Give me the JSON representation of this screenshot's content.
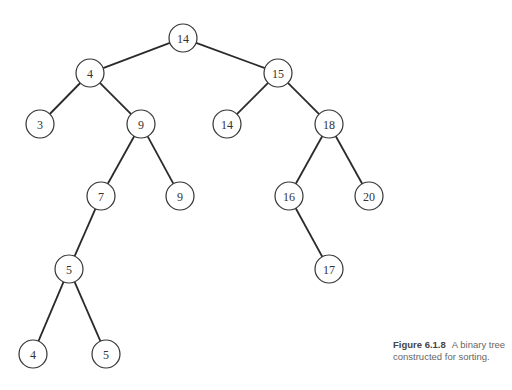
{
  "figure": {
    "caption_number": "Figure 6.1.8",
    "caption_text": "A binary tree constructed for sorting."
  },
  "tree": {
    "node_radius": 14,
    "nodes": [
      {
        "id": "n1",
        "label": "14",
        "x": 183,
        "y": 38
      },
      {
        "id": "n2",
        "label": "4",
        "x": 90,
        "y": 73
      },
      {
        "id": "n3",
        "label": "15",
        "x": 278,
        "y": 73
      },
      {
        "id": "n4",
        "label": "3",
        "x": 40,
        "y": 124
      },
      {
        "id": "n5",
        "label": "9",
        "x": 141,
        "y": 124
      },
      {
        "id": "n6",
        "label": "14",
        "x": 227,
        "y": 124
      },
      {
        "id": "n7",
        "label": "18",
        "x": 329,
        "y": 124
      },
      {
        "id": "n8",
        "label": "7",
        "x": 101,
        "y": 196
      },
      {
        "id": "n9",
        "label": "9",
        "x": 180,
        "y": 196
      },
      {
        "id": "n10",
        "label": "16",
        "x": 289,
        "y": 196
      },
      {
        "id": "n11",
        "label": "20",
        "x": 369,
        "y": 196
      },
      {
        "id": "n12",
        "label": "5",
        "x": 69,
        "y": 269
      },
      {
        "id": "n13",
        "label": "17",
        "x": 329,
        "y": 269
      },
      {
        "id": "n14",
        "label": "4",
        "x": 33,
        "y": 354
      },
      {
        "id": "n15",
        "label": "5",
        "x": 106,
        "y": 354
      }
    ],
    "edges": [
      [
        "n1",
        "n2"
      ],
      [
        "n1",
        "n3"
      ],
      [
        "n2",
        "n4"
      ],
      [
        "n2",
        "n5"
      ],
      [
        "n3",
        "n6"
      ],
      [
        "n3",
        "n7"
      ],
      [
        "n5",
        "n8"
      ],
      [
        "n5",
        "n9"
      ],
      [
        "n7",
        "n10"
      ],
      [
        "n7",
        "n11"
      ],
      [
        "n8",
        "n12"
      ],
      [
        "n10",
        "n13"
      ],
      [
        "n12",
        "n14"
      ],
      [
        "n12",
        "n15"
      ]
    ]
  }
}
